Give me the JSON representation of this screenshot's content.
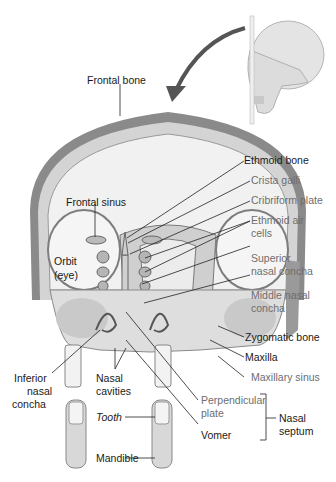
{
  "colors": {
    "label_primary": "#1a1a1a",
    "label_secondary": "#6e6e6e",
    "bone_outer": "#8a8a8a",
    "bone_inner": "#d9d9d9",
    "cavity": "#f2f2f2"
  },
  "labels": {
    "frontal_bone": "Frontal bone",
    "ethmoid_bone": "Ethmoid bone",
    "crista_galli": "Crista galli",
    "cribriform_plate": "Cribriform plate",
    "ethmoid_air_cells_1": "Ethmoid air",
    "ethmoid_air_cells_2": "cells",
    "frontal_sinus": "Frontal sinus",
    "orbit_1": "Orbit",
    "orbit_2": "(eye)",
    "superior_nasal_concha_1": "Superior",
    "superior_nasal_concha_2": "nasal concha",
    "middle_nasal_concha_1": "Middle nasal",
    "middle_nasal_concha_2": "concha",
    "zygomatic_bone": "Zygomatic bone",
    "maxilla": "Maxilla",
    "inferior_nasal_concha_1": "Inferior",
    "inferior_nasal_concha_2": "nasal",
    "inferior_nasal_concha_3": "concha",
    "nasal_cavities_1": "Nasal",
    "nasal_cavities_2": "cavities",
    "maxillary_sinus": "Maxillary sinus",
    "perpendicular_plate_1": "Perpendicular",
    "perpendicular_plate_2": "plate",
    "nasal_septum_1": "Nasal",
    "nasal_septum_2": "septum",
    "tooth": "Tooth",
    "vomer": "Vomer",
    "mandible": "Mandible"
  }
}
